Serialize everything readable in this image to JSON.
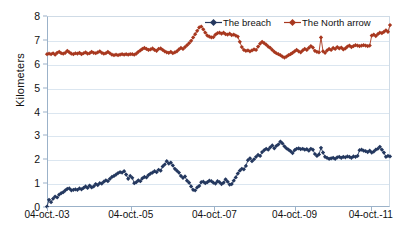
{
  "chart_data": {
    "type": "line",
    "title": "",
    "xlabel": "",
    "ylabel": "Kilometers",
    "ylim": [
      0,
      8
    ],
    "ytick_values": [
      0,
      1,
      2,
      3,
      4,
      5,
      6,
      7,
      8
    ],
    "ytick_labels": [
      "0",
      "1",
      "2",
      "3",
      "4",
      "5",
      "6",
      "7",
      "8"
    ],
    "xtick_labels": [
      "04-oct.-03",
      "04-oct.-05",
      "04-oct.-07",
      "04-oct.-09",
      "04-oct.-11"
    ],
    "xtick_positions": [
      0.0,
      0.244,
      0.488,
      0.722,
      0.944
    ],
    "grid": true,
    "grid_axis": "y",
    "legend_position": "top-center",
    "marker": "diamond",
    "series": [
      {
        "name": "The breach",
        "color": "#24385F",
        "values": [
          0.02,
          0.3,
          0.2,
          0.35,
          0.44,
          0.4,
          0.52,
          0.58,
          0.62,
          0.7,
          0.76,
          0.78,
          0.7,
          0.72,
          0.74,
          0.72,
          0.78,
          0.74,
          0.8,
          0.86,
          0.8,
          0.9,
          0.82,
          0.86,
          0.96,
          0.92,
          1.0,
          0.98,
          1.06,
          1.12,
          1.08,
          1.18,
          1.26,
          1.3,
          1.36,
          1.42,
          1.46,
          1.44,
          1.5,
          1.36,
          1.18,
          1.3,
          1.22,
          1.0,
          1.04,
          1.12,
          1.08,
          1.2,
          1.26,
          1.24,
          1.34,
          1.4,
          1.44,
          1.5,
          1.46,
          1.56,
          1.52,
          1.7,
          1.78,
          1.92,
          1.82,
          1.86,
          1.74,
          1.6,
          1.52,
          1.44,
          1.3,
          1.22,
          1.28,
          1.1,
          1.02,
          0.86,
          0.72,
          0.7,
          0.82,
          0.88,
          1.04,
          1.06,
          1.0,
          1.04,
          1.1,
          1.08,
          1.02,
          0.98,
          1.08,
          1.04,
          0.96,
          1.02,
          1.16,
          1.06,
          0.94,
          0.96,
          1.1,
          1.24,
          1.4,
          1.52,
          1.6,
          1.58,
          1.72,
          1.96,
          2.04,
          1.92,
          2.0,
          2.1,
          2.18,
          2.14,
          2.3,
          2.38,
          2.44,
          2.4,
          2.5,
          2.58,
          2.46,
          2.56,
          2.62,
          2.74,
          2.66,
          2.54,
          2.46,
          2.4,
          2.34,
          2.26,
          2.38,
          2.44,
          2.46,
          2.42,
          2.44,
          2.4,
          2.42,
          2.36,
          2.44,
          2.4,
          2.22,
          2.14,
          2.2,
          2.48,
          2.28,
          2.1,
          2.06,
          2.02,
          2.04,
          2.06,
          2.02,
          2.08,
          2.1,
          2.06,
          2.1,
          2.08,
          2.12,
          2.1,
          2.06,
          2.12,
          2.1,
          2.14,
          2.38,
          2.4,
          2.36,
          2.34,
          2.3,
          2.36,
          2.28,
          2.32,
          2.4,
          2.44,
          2.52,
          2.4,
          2.28,
          2.1,
          2.14,
          2.12
        ]
      },
      {
        "name": "The North arrow",
        "color": "#A8381F",
        "values": [
          6.4,
          6.42,
          6.4,
          6.44,
          6.38,
          6.46,
          6.5,
          6.44,
          6.42,
          6.46,
          6.54,
          6.48,
          6.42,
          6.4,
          6.44,
          6.42,
          6.46,
          6.4,
          6.44,
          6.48,
          6.42,
          6.44,
          6.5,
          6.46,
          6.44,
          6.48,
          6.52,
          6.46,
          6.42,
          6.44,
          6.5,
          6.44,
          6.38,
          6.36,
          6.38,
          6.36,
          6.38,
          6.4,
          6.38,
          6.4,
          6.38,
          6.4,
          6.4,
          6.38,
          6.42,
          6.5,
          6.56,
          6.62,
          6.66,
          6.62,
          6.58,
          6.6,
          6.64,
          6.58,
          6.54,
          6.62,
          6.64,
          6.58,
          6.52,
          6.48,
          6.46,
          6.5,
          6.44,
          6.48,
          6.52,
          6.6,
          6.66,
          6.62,
          6.7,
          6.78,
          6.86,
          6.96,
          7.1,
          7.24,
          7.38,
          7.52,
          7.56,
          7.44,
          7.3,
          7.18,
          7.14,
          7.1,
          7.12,
          7.22,
          7.28,
          7.3,
          7.26,
          7.3,
          7.24,
          7.22,
          7.26,
          7.2,
          7.22,
          7.18,
          7.14,
          6.92,
          6.7,
          6.58,
          6.54,
          6.56,
          6.52,
          6.56,
          6.6,
          6.58,
          6.72,
          6.84,
          6.92,
          6.86,
          6.8,
          6.72,
          6.66,
          6.58,
          6.5,
          6.44,
          6.4,
          6.36,
          6.3,
          6.26,
          6.3,
          6.36,
          6.4,
          6.46,
          6.52,
          6.58,
          6.52,
          6.48,
          6.56,
          6.62,
          6.58,
          6.66,
          6.74,
          6.68,
          6.54,
          6.5,
          6.48,
          7.1,
          6.52,
          6.46,
          6.56,
          6.62,
          6.58,
          6.66,
          6.62,
          6.7,
          6.64,
          6.68,
          6.6,
          6.64,
          6.72,
          6.76,
          6.7,
          6.74,
          6.78,
          6.76,
          6.74,
          6.76,
          6.78,
          6.76,
          6.74,
          6.76,
          7.18,
          7.22,
          7.16,
          7.24,
          7.3,
          7.28,
          7.34,
          7.4,
          7.34,
          7.62
        ]
      }
    ]
  },
  "legend": {
    "items": [
      {
        "label": "The breach",
        "color": "#24385F"
      },
      {
        "label": "The North arrow",
        "color": "#A8381F"
      }
    ]
  },
  "axes": {
    "y_title": "Kilometers"
  }
}
